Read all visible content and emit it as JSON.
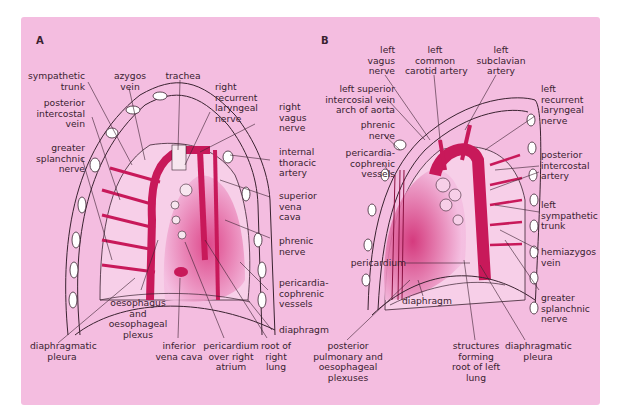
{
  "figure": {
    "panel_background": "#f4bde0",
    "vessel_color": "#c8195a",
    "pleura_color": "#e27ab0",
    "line_color": "#3a2230"
  },
  "panel_a": {
    "letter": "A",
    "labels": {
      "sympathetic_trunk": "sympathetic\ntrunk",
      "azygos_vein": "azygos\nvein",
      "trachea": "trachea",
      "right_recurrent_laryngeal_nerve": "right\nrecurrent\nlaryngeal\nnerve",
      "right_vagus_nerve": "right\nvagus\nnerve",
      "posterior_intercostal_vein": "posterior\nintercostal\nvein",
      "greater_splanchnic_nerve": "greater\nsplanchnic\nnerve",
      "internal_thoracic_artery": "internal\nthoracic\nartery",
      "superior_vena_cava": "superior\nvena\ncava",
      "phrenic_nerve": "phrenic\nnerve",
      "pericardiacophrenic_vessels": "pericardia-\ncophrenic\nvessels",
      "diaphragm": "diaphragm",
      "oesophagus_and_plexus": "oesophagus\nand\noesophageal\nplexus",
      "diaphragmatic_pleura": "diaphragmatic\npleura",
      "inferior_vena_cava": "inferior\nvena cava",
      "pericardium_over_right_atrium": "pericardium\nover right\natrium",
      "root_of_right_lung": "root of\nright\nlung"
    }
  },
  "panel_b": {
    "letter": "B",
    "labels": {
      "left_vagus_nerve": "left\nvagus\nnerve",
      "left_common_carotid_artery": "left\ncommon\ncarotid artery",
      "left_subclavian_artery": "left\nsubclavian\nartery",
      "left_superior_intercostal_vein": "left superior\nintercosial vein\narch of aorta",
      "left_recurrent_laryngeal_nerve": "left\nrecurrent\nlaryngeal\nnerve",
      "phrenic_nerve": "phrenic\nnerve",
      "pericardiacophrenic_vessels": "pericardia-\ncophrenic\nvessels",
      "posterior_intercostal_artery": "posterior\nintercostal\nartery",
      "left_sympathetic_trunk": "left\nsympathetic\ntrunk",
      "pericardium": "pericardium",
      "hemiazygos_vein": "hemiazygos\nvein",
      "diaphragm": "diaphragm",
      "greater_splanchnic_nerve": "greater\nsplanchnic\nnerve",
      "posterior_pulmonary_plexuses": "posterior\npulmonary and\noesophageal\nplexuses",
      "structures_root_left_lung": "structures\nforming\nroot of left\nlung",
      "diaphragmatic_pleura": "diaphragmatic\npleura"
    }
  }
}
